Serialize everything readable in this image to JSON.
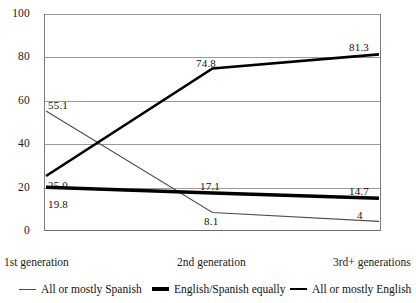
{
  "chart_data": {
    "type": "line",
    "title": "",
    "subtitle": "",
    "xlabel": "",
    "ylabel": "",
    "categories": [
      "1st generation",
      "2nd generation",
      "3rd+ generations"
    ],
    "ylim": [
      0,
      100
    ],
    "yticks": [
      0,
      20,
      40,
      60,
      80,
      100
    ],
    "grid": true,
    "legend_position": "bottom",
    "series": [
      {
        "name": "All or mostly Spanish",
        "values": [
          55.1,
          8.1,
          4
        ],
        "labels": [
          "55.1",
          "8.1",
          "4"
        ],
        "color": "#4d4d4d",
        "stroke_width": 1.1
      },
      {
        "name": "English/Spanish equally",
        "values": [
          19.8,
          17.1,
          14.7
        ],
        "labels": [
          "19.8",
          "17.1",
          "14.7"
        ],
        "color": "#000000",
        "stroke_width": 3.6
      },
      {
        "name": "All or mostly English",
        "values": [
          25.0,
          74.8,
          81.3
        ],
        "labels": [
          "25.0",
          "74.8",
          "81.3"
        ],
        "color": "#000000",
        "stroke_width": 2.6
      }
    ]
  },
  "axis": {
    "y_tick_labels": [
      "100",
      "80",
      "60",
      "40",
      "20",
      "0"
    ]
  },
  "legend": {
    "items": [
      {
        "label": "All or mostly Spanish"
      },
      {
        "label": "English/Spanish equally"
      },
      {
        "label": "All or mostly English"
      }
    ]
  },
  "point_labels": {
    "spanish_g1": "55.1",
    "spanish_g2": "8.1",
    "spanish_g3": "4",
    "equally_g1": "19.8",
    "equally_g2": "17.1",
    "equally_g3": "14.7",
    "english_g1": "25.0",
    "english_g2": "74.8",
    "english_g3": "81.3"
  }
}
